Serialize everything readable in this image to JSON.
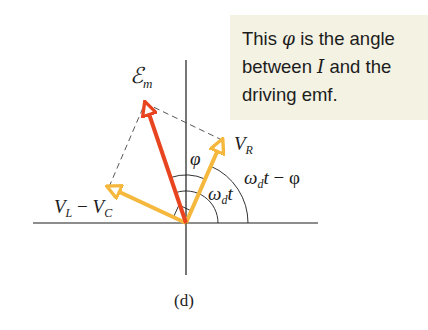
{
  "callout": {
    "line1_pre": "This ",
    "line1_sym": "φ",
    "line1_post": " is the angle",
    "line2_pre": "between ",
    "line2_sym": "I",
    "line2_post": " and the",
    "line3": "driving emf.",
    "background": "#f3f2e3"
  },
  "phasor_diagram": {
    "origin": [
      186,
      223
    ],
    "colors": {
      "emf_arrow": "#e8441f",
      "voltage_arrows": "#f5b83d",
      "axes": "#1c1c1c",
      "dashed": "#444444"
    },
    "labels": {
      "emf": "ℰ",
      "emf_sub": "m",
      "vr": "V",
      "vr_sub": "R",
      "vlvc_a": "V",
      "vlvc_a_sub": "L",
      "vlvc_minus": " − ",
      "vlvc_b": "V",
      "vlvc_b_sub": "C",
      "phi": "φ",
      "omega_t_inner_omega": "ω",
      "omega_t_inner_sub": "d",
      "omega_t_inner_t": "t",
      "omega_t_outer_omega": "ω",
      "omega_t_outer_sub": "d",
      "omega_t_outer_t": "t",
      "omega_t_outer_minus": " − φ"
    },
    "caption": "(d)"
  }
}
